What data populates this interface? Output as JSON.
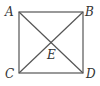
{
  "diagram": {
    "type": "geometry",
    "shape": "square with diagonals",
    "vertices": [
      {
        "name": "A",
        "label": "A",
        "x": 19,
        "y": 12
      },
      {
        "name": "B",
        "label": "B",
        "x": 83,
        "y": 12
      },
      {
        "name": "C",
        "label": "C",
        "x": 19,
        "y": 73
      },
      {
        "name": "D",
        "label": "D",
        "x": 83,
        "y": 73
      }
    ],
    "intersection": {
      "name": "E",
      "label": "E",
      "x": 51,
      "y": 43
    },
    "segments": [
      "AB",
      "BD",
      "DC",
      "CA",
      "AD",
      "BC"
    ],
    "colors": {
      "line": "#555555",
      "text": "#333333",
      "background": "#ffffff"
    }
  }
}
